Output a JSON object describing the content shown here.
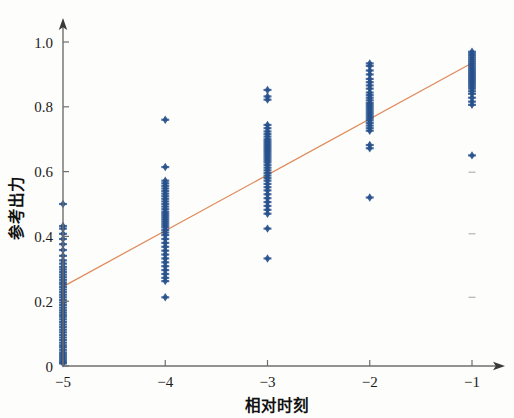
{
  "chart_data": {
    "type": "scatter",
    "title": "",
    "subtitle": "",
    "xlabel": "相对时刻",
    "ylabel": "参考出力",
    "xlim": [
      -5.45,
      -0.45
    ],
    "ylim": [
      -0.02,
      1.08
    ],
    "xticks": [
      -5,
      -4,
      -3,
      -2,
      -1
    ],
    "xticklabels": [
      "−5",
      "−4",
      "−3",
      "−2",
      "−1"
    ],
    "yticks": [
      0,
      0.2,
      0.4,
      0.6,
      0.8,
      1.0
    ],
    "yticklabels": [
      "0",
      "0.2",
      "0.4",
      "0.6",
      "0.8",
      "1.0"
    ],
    "grid": false,
    "legend": null,
    "marker_style": "diamond-plus",
    "marker_color": "#27518c",
    "marker_size": 4.2,
    "axis_style": "arrow-spines",
    "series": [
      {
        "name": "reference-output-samples",
        "type": "scatter",
        "color": "#27518c",
        "points": [
          [
            -5,
            0.008
          ],
          [
            -5,
            0.012
          ],
          [
            -5,
            0.018
          ],
          [
            -5,
            0.024
          ],
          [
            -5,
            0.03
          ],
          [
            -5,
            0.036
          ],
          [
            -5,
            0.042
          ],
          [
            -5,
            0.05
          ],
          [
            -5,
            0.058
          ],
          [
            -5,
            0.064
          ],
          [
            -5,
            0.072
          ],
          [
            -5,
            0.08
          ],
          [
            -5,
            0.088
          ],
          [
            -5,
            0.096
          ],
          [
            -5,
            0.104
          ],
          [
            -5,
            0.112
          ],
          [
            -5,
            0.12
          ],
          [
            -5,
            0.128
          ],
          [
            -5,
            0.136
          ],
          [
            -5,
            0.144
          ],
          [
            -5,
            0.152
          ],
          [
            -5,
            0.158
          ],
          [
            -5,
            0.165
          ],
          [
            -5,
            0.172
          ],
          [
            -5,
            0.18
          ],
          [
            -5,
            0.188
          ],
          [
            -5,
            0.196
          ],
          [
            -5,
            0.204
          ],
          [
            -5,
            0.212
          ],
          [
            -5,
            0.22
          ],
          [
            -5,
            0.228
          ],
          [
            -5,
            0.236
          ],
          [
            -5,
            0.244
          ],
          [
            -5,
            0.252
          ],
          [
            -5,
            0.258
          ],
          [
            -5,
            0.266
          ],
          [
            -5,
            0.274
          ],
          [
            -5,
            0.282
          ],
          [
            -5,
            0.29
          ],
          [
            -5,
            0.298
          ],
          [
            -5,
            0.306
          ],
          [
            -5,
            0.316
          ],
          [
            -5,
            0.326
          ],
          [
            -5,
            0.34
          ],
          [
            -5,
            0.358
          ],
          [
            -5,
            0.376
          ],
          [
            -5,
            0.392
          ],
          [
            -5,
            0.408
          ],
          [
            -5,
            0.424
          ],
          [
            -5,
            0.432
          ],
          [
            -5,
            0.5
          ],
          [
            -4,
            0.212
          ],
          [
            -4,
            0.262
          ],
          [
            -4,
            0.272
          ],
          [
            -4,
            0.284
          ],
          [
            -4,
            0.296
          ],
          [
            -4,
            0.308
          ],
          [
            -4,
            0.32
          ],
          [
            -4,
            0.332
          ],
          [
            -4,
            0.344
          ],
          [
            -4,
            0.356
          ],
          [
            -4,
            0.368
          ],
          [
            -4,
            0.38
          ],
          [
            -4,
            0.392
          ],
          [
            -4,
            0.404
          ],
          [
            -4,
            0.412
          ],
          [
            -4,
            0.42
          ],
          [
            -4,
            0.428
          ],
          [
            -4,
            0.434
          ],
          [
            -4,
            0.44
          ],
          [
            -4,
            0.446
          ],
          [
            -4,
            0.452
          ],
          [
            -4,
            0.458
          ],
          [
            -4,
            0.464
          ],
          [
            -4,
            0.47
          ],
          [
            -4,
            0.476
          ],
          [
            -4,
            0.484
          ],
          [
            -4,
            0.492
          ],
          [
            -4,
            0.5
          ],
          [
            -4,
            0.508
          ],
          [
            -4,
            0.516
          ],
          [
            -4,
            0.524
          ],
          [
            -4,
            0.532
          ],
          [
            -4,
            0.54
          ],
          [
            -4,
            0.548
          ],
          [
            -4,
            0.556
          ],
          [
            -4,
            0.564
          ],
          [
            -4,
            0.572
          ],
          [
            -4,
            0.614
          ],
          [
            -4,
            0.76
          ]
        ]
      },
      {
        "name": "reference-output-samples-cont",
        "type": "scatter",
        "color": "#27518c",
        "points": [
          [
            -3,
            0.332
          ],
          [
            -3,
            0.424
          ],
          [
            -3,
            0.47
          ],
          [
            -3,
            0.482
          ],
          [
            -3,
            0.494
          ],
          [
            -3,
            0.506
          ],
          [
            -3,
            0.518
          ],
          [
            -3,
            0.53
          ],
          [
            -3,
            0.542
          ],
          [
            -3,
            0.552
          ],
          [
            -3,
            0.562
          ],
          [
            -3,
            0.572
          ],
          [
            -3,
            0.58
          ],
          [
            -3,
            0.588
          ],
          [
            -3,
            0.596
          ],
          [
            -3,
            0.604
          ],
          [
            -3,
            0.612
          ],
          [
            -3,
            0.62
          ],
          [
            -3,
            0.628
          ],
          [
            -3,
            0.634
          ],
          [
            -3,
            0.64
          ],
          [
            -3,
            0.646
          ],
          [
            -3,
            0.652
          ],
          [
            -3,
            0.658
          ],
          [
            -3,
            0.664
          ],
          [
            -3,
            0.67
          ],
          [
            -3,
            0.676
          ],
          [
            -3,
            0.682
          ],
          [
            -3,
            0.688
          ],
          [
            -3,
            0.694
          ],
          [
            -3,
            0.7
          ],
          [
            -3,
            0.708
          ],
          [
            -3,
            0.716
          ],
          [
            -3,
            0.724
          ],
          [
            -3,
            0.734
          ],
          [
            -3,
            0.744
          ],
          [
            -3,
            0.822
          ],
          [
            -3,
            0.832
          ],
          [
            -3,
            0.852
          ],
          [
            -2,
            0.52
          ],
          [
            -2,
            0.672
          ],
          [
            -2,
            0.682
          ],
          [
            -2,
            0.726
          ],
          [
            -2,
            0.734
          ],
          [
            -2,
            0.742
          ],
          [
            -2,
            0.75
          ],
          [
            -2,
            0.758
          ],
          [
            -2,
            0.764
          ],
          [
            -2,
            0.77
          ],
          [
            -2,
            0.776
          ],
          [
            -2,
            0.782
          ],
          [
            -2,
            0.788
          ],
          [
            -2,
            0.794
          ],
          [
            -2,
            0.8
          ],
          [
            -2,
            0.806
          ],
          [
            -2,
            0.812
          ],
          [
            -2,
            0.82
          ],
          [
            -2,
            0.828
          ],
          [
            -2,
            0.836
          ],
          [
            -2,
            0.844
          ],
          [
            -2,
            0.856
          ],
          [
            -2,
            0.866
          ],
          [
            -2,
            0.876
          ],
          [
            -2,
            0.886
          ],
          [
            -2,
            0.9
          ],
          [
            -2,
            0.912
          ],
          [
            -2,
            0.926
          ],
          [
            -2,
            0.934
          ],
          [
            -1,
            0.65
          ],
          [
            -1,
            0.806
          ],
          [
            -1,
            0.816
          ],
          [
            -1,
            0.828
          ],
          [
            -1,
            0.84
          ],
          [
            -1,
            0.848
          ],
          [
            -1,
            0.856
          ],
          [
            -1,
            0.862
          ],
          [
            -1,
            0.868
          ],
          [
            -1,
            0.874
          ],
          [
            -1,
            0.88
          ],
          [
            -1,
            0.886
          ],
          [
            -1,
            0.892
          ],
          [
            -1,
            0.898
          ],
          [
            -1,
            0.904
          ],
          [
            -1,
            0.91
          ],
          [
            -1,
            0.916
          ],
          [
            -1,
            0.922
          ],
          [
            -1,
            0.928
          ],
          [
            -1,
            0.934
          ],
          [
            -1,
            0.94
          ],
          [
            -1,
            0.946
          ],
          [
            -1,
            0.952
          ],
          [
            -1,
            0.958
          ],
          [
            -1,
            0.964
          ],
          [
            -1,
            0.97
          ]
        ]
      },
      {
        "name": "linear-fit-line",
        "type": "line",
        "color": "#e08a5a",
        "points": [
          [
            -5,
            0.245
          ],
          [
            -1,
            0.935
          ]
        ]
      }
    ],
    "scan_artifacts": [
      [
        -1,
        0.598
      ],
      [
        -1,
        0.408
      ],
      [
        -1,
        0.212
      ]
    ]
  },
  "figure": {
    "background_color": "#fdfdfb",
    "axis_color": "#6e6e6e",
    "text_color": "#1c1c1c"
  }
}
